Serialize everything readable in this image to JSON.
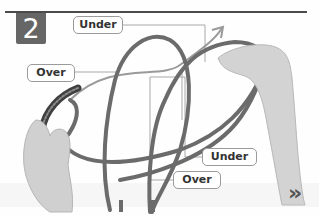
{
  "step": {
    "number": "2"
  },
  "callouts": {
    "under_top": "Under",
    "over_left": "Over",
    "under_bottom": "Under",
    "over_bottom": "Over"
  },
  "navigation": {
    "next_glyph": "»"
  },
  "colors": {
    "badge": "#666666",
    "rope": "#6b6b6b",
    "rope_dark": "#3f3f3f",
    "leader_line": "#a8a8a8",
    "arrow": "#9a9a9a",
    "hand": "#cfcfcf",
    "rule": "#4a4a4a"
  }
}
